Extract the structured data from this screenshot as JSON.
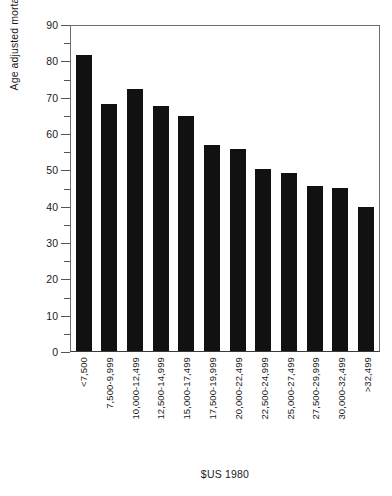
{
  "chart_data": {
    "type": "bar",
    "title": "",
    "xlabel": "$US 1980",
    "ylabel": "Age adjusted mortality rate per 10,000 person years",
    "ylim": [
      0,
      90
    ],
    "ytick_step": 10,
    "minor_ticks": true,
    "grid": false,
    "legend": "none",
    "bar_color": "#111111",
    "categories": [
      "<7,500",
      "7,500-9,999",
      "10,000-12,499",
      "12,500-14,999",
      "15,000-17,499",
      "17,500-19,999",
      "20,000-22,499",
      "22,500-24,999",
      "25,000-27,499",
      "27,500-29,999",
      "30,000-32,499",
      ">32,499"
    ],
    "values": [
      81.5,
      68.0,
      72.0,
      67.5,
      64.8,
      56.6,
      55.5,
      50.0,
      49.0,
      45.5,
      44.8,
      39.5
    ],
    "yticks": [
      90,
      80,
      70,
      60,
      50,
      40,
      30,
      20,
      10,
      0
    ],
    "ytick_labels": [
      "90",
      "80",
      "70",
      "60",
      "50",
      "40",
      "30",
      "20",
      "10",
      "0"
    ]
  }
}
